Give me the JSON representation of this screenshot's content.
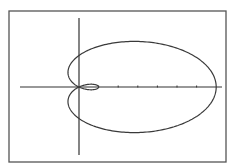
{
  "chart_data": {
    "type": "line",
    "title": "",
    "equation": "r = 3 + 4cos(θ)",
    "xlabel": "",
    "ylabel": "",
    "xlim": [
      -3,
      7.3
    ],
    "x_ticks": [
      1,
      2,
      3,
      4,
      5,
      6
    ],
    "grid": false,
    "legend": null,
    "series": [
      {
        "name": "limacon",
        "a": 3,
        "b": 4,
        "theta_range": [
          0,
          6.2832
        ]
      }
    ],
    "key_points": {
      "outer_loop_right_x": 7,
      "inner_loop_right_x": 1,
      "y_axis_crossing": 3
    }
  },
  "style": {
    "frame_color": "#555555",
    "axis_color": "#333333",
    "curve_color": "#3a3a3a",
    "background": "#ffffff"
  },
  "layout": {
    "frame": {
      "x": 9,
      "y": 11,
      "w": 217,
      "h": 151
    },
    "origin": {
      "x": 79,
      "y": 87
    },
    "x_axis": {
      "x1": 20,
      "x2": 222
    },
    "y_axis": {
      "y1": 18,
      "y2": 155
    },
    "scale_x": 19.6,
    "scale_y": 10.5
  }
}
